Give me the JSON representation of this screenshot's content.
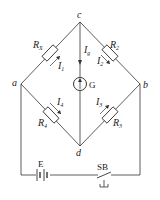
{
  "diagram": {
    "nodes": {
      "a": "a",
      "b": "b",
      "c": "c",
      "d": "d"
    },
    "resistors": [
      {
        "name": "R",
        "sub": "X",
        "branch": "a-c",
        "current": "I",
        "current_sub": "1"
      },
      {
        "name": "R",
        "sub": "2",
        "branch": "c-b",
        "current": "I",
        "current_sub": "2"
      },
      {
        "name": "R",
        "sub": "4",
        "branch": "a-d",
        "current": "I",
        "current_sub": "4"
      },
      {
        "name": "R",
        "sub": "3",
        "branch": "d-b",
        "current": "I",
        "current_sub": "3"
      }
    ],
    "galvanometer": {
      "label": "G",
      "current": "I",
      "current_sub": "g",
      "branch": "c-d"
    },
    "battery": {
      "label": "E"
    },
    "switch": {
      "label": "SB"
    }
  }
}
